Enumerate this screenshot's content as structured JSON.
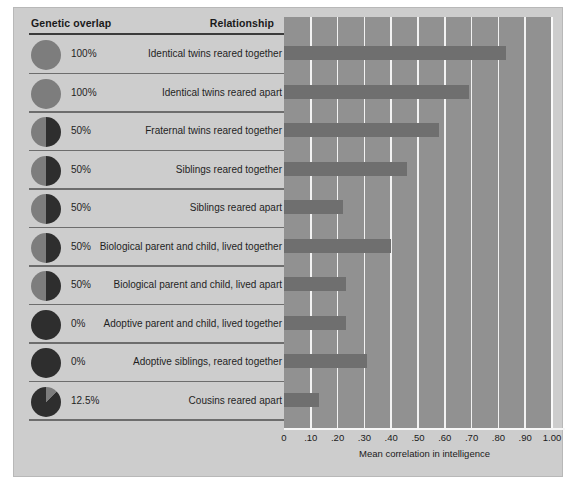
{
  "figure": {
    "background_color": "#cdcdcd",
    "plot_background_color": "#919191",
    "bar_color": "#6f6f6f",
    "grid_color": "#f2f2f2",
    "pie_light_color": "#7d7d7d",
    "pie_dark_color": "#2e2e2e"
  },
  "table": {
    "header_genetic": "Genetic overlap",
    "header_relationship": "Relationship"
  },
  "rows": [
    {
      "overlap": "100%",
      "relationship": "Identical twins reared together",
      "pie": 100
    },
    {
      "overlap": "100%",
      "relationship": "Identical twins reared apart",
      "pie": 100
    },
    {
      "overlap": "50%",
      "relationship": "Fraternal twins reared together",
      "pie": 50
    },
    {
      "overlap": "50%",
      "relationship": "Siblings reared together",
      "pie": 50
    },
    {
      "overlap": "50%",
      "relationship": "Siblings reared apart",
      "pie": 50
    },
    {
      "overlap": "50%",
      "relationship": "Biological parent and child, lived together",
      "pie": 50
    },
    {
      "overlap": "50%",
      "relationship": "Biological parent and child, lived apart",
      "pie": 50
    },
    {
      "overlap": "0%",
      "relationship": "Adoptive parent and child, lived together",
      "pie": 0
    },
    {
      "overlap": "0%",
      "relationship": "Adoptive siblings, reared together",
      "pie": 0
    },
    {
      "overlap": "12.5%",
      "relationship": "Cousins reared apart",
      "pie": 12.5
    }
  ],
  "chart_data": {
    "type": "bar",
    "orientation": "horizontal",
    "title": "",
    "xlabel": "Mean correlation in intelligence",
    "ylabel": "",
    "xlim": [
      0,
      1.0
    ],
    "grid": true,
    "legend": "none",
    "categories": [
      "Identical twins reared together",
      "Identical twins reared apart",
      "Fraternal twins reared together",
      "Siblings reared together",
      "Siblings reared apart",
      "Biological parent and child, lived together",
      "Biological parent and child, lived apart",
      "Adoptive parent and child, lived together",
      "Adoptive siblings, reared together",
      "Cousins reared apart"
    ],
    "values": [
      0.83,
      0.69,
      0.58,
      0.46,
      0.22,
      0.4,
      0.23,
      0.23,
      0.31,
      0.13
    ],
    "tick_labels": [
      "0",
      ".10",
      ".20",
      ".30",
      ".40",
      ".50",
      ".60",
      ".70",
      ".80",
      ".90",
      "1.00"
    ],
    "tick_values": [
      0,
      0.1,
      0.2,
      0.3,
      0.4,
      0.5,
      0.6,
      0.7,
      0.8,
      0.9,
      1.0
    ]
  }
}
